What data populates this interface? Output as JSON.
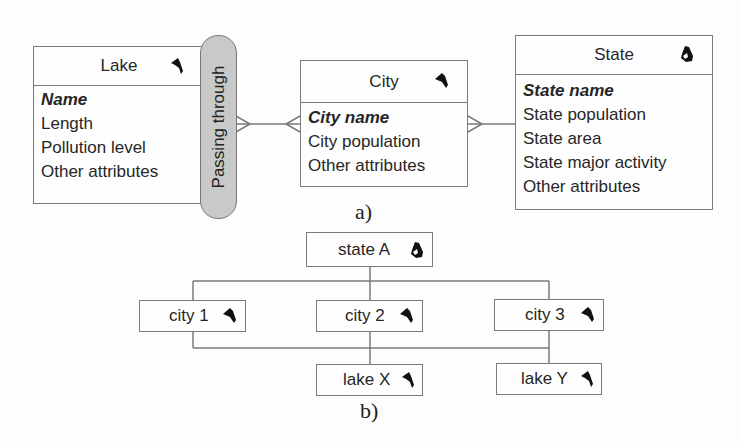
{
  "figure_a": {
    "caption": "a)",
    "entities": {
      "lake": {
        "title": "Lake",
        "icon": "lake-shape-icon",
        "attributes": [
          {
            "label": "Name",
            "is_key": true
          },
          {
            "label": "Length",
            "is_key": false
          },
          {
            "label": "Pollution level",
            "is_key": false
          },
          {
            "label": "Other attributes",
            "is_key": false
          }
        ]
      },
      "city": {
        "title": "City",
        "icon": "city-shape-icon",
        "attributes": [
          {
            "label": "City name",
            "is_key": true
          },
          {
            "label": "City population",
            "is_key": false
          },
          {
            "label": "Other attributes",
            "is_key": false
          }
        ]
      },
      "state": {
        "title": "State",
        "icon": "state-shape-icon",
        "attributes": [
          {
            "label": "State name",
            "is_key": true
          },
          {
            "label": "State population",
            "is_key": false
          },
          {
            "label": "State area",
            "is_key": false
          },
          {
            "label": "State major activity",
            "is_key": false
          },
          {
            "label": "Other attributes",
            "is_key": false
          }
        ]
      }
    },
    "relationship": {
      "label": "Passing through",
      "between": [
        "Lake",
        "City"
      ],
      "cardinality": "many-to-many"
    },
    "city_state_relationship": {
      "between": [
        "City",
        "State"
      ],
      "cardinality": "many-to-one"
    }
  },
  "figure_b": {
    "caption": "b)",
    "nodes": {
      "state_a": "state A",
      "city_1": "city 1",
      "city_2": "city 2",
      "city_3": "city 3",
      "lake_x": "lake X",
      "lake_y": "lake Y"
    }
  },
  "colors": {
    "border": "#7a7a7a",
    "pill_fill": "#c9c9c9",
    "text": "#262626",
    "icon": "#111111"
  }
}
